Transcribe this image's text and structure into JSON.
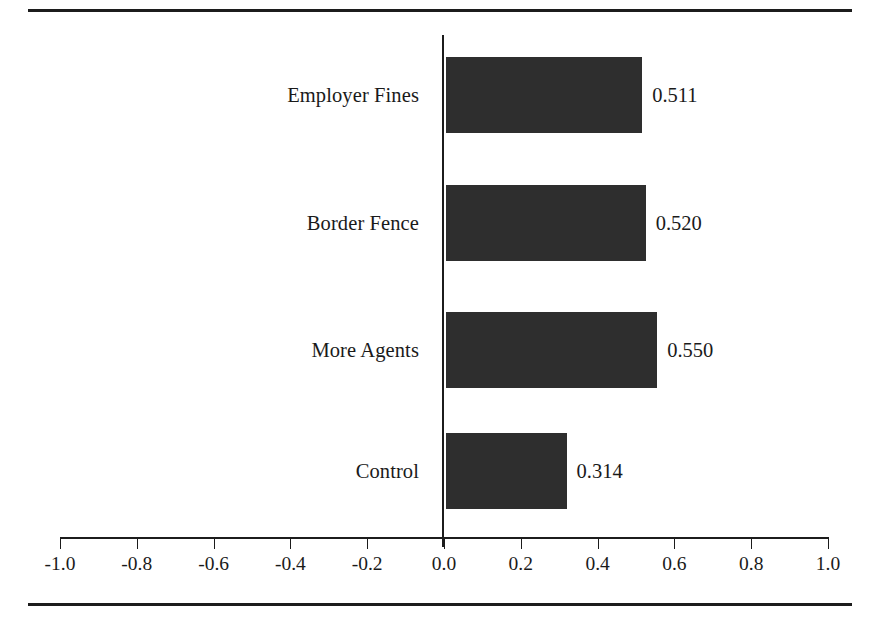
{
  "chart_data": {
    "type": "bar",
    "orientation": "horizontal",
    "title": "",
    "subtitle": "",
    "xlabel": "",
    "ylabel": "",
    "categories": [
      "Employer Fines",
      "Border Fence",
      "More Agents",
      "Control"
    ],
    "values": [
      0.511,
      0.52,
      0.55,
      0.314
    ],
    "value_labels": [
      "0.511",
      "0.520",
      "0.550",
      "0.314"
    ],
    "series": [
      {
        "name": "",
        "values": [
          0.511,
          0.52,
          0.55,
          0.314
        ]
      }
    ],
    "xlim": [
      -1.0,
      1.0
    ],
    "xticks": [
      -1.0,
      -0.8,
      -0.6,
      -0.4,
      -0.2,
      0.0,
      0.2,
      0.4,
      0.6,
      0.8,
      1.0
    ],
    "xtick_labels": [
      "-1.0",
      "-0.8",
      "-0.6",
      "-0.4",
      "-0.2",
      "0.0",
      "0.2",
      "0.4",
      "0.6",
      "0.8",
      "1.0"
    ],
    "grid": false,
    "legend": null,
    "legend_position": "none",
    "annotations": [],
    "colors": {
      "bar_fill": "#2e2e2e",
      "axis": "#1c1c1c",
      "rule": "#1c1c1c",
      "text": "#1a1a1a",
      "background": "#ffffff"
    },
    "bars": [
      {
        "category": "Employer Fines",
        "value": 0.511,
        "label": "0.511"
      },
      {
        "category": "Border Fence",
        "value": 0.52,
        "label": "0.520"
      },
      {
        "category": "More Agents",
        "value": 0.55,
        "label": "0.550"
      },
      {
        "category": "Control",
        "value": 0.314,
        "label": "0.314"
      }
    ]
  }
}
